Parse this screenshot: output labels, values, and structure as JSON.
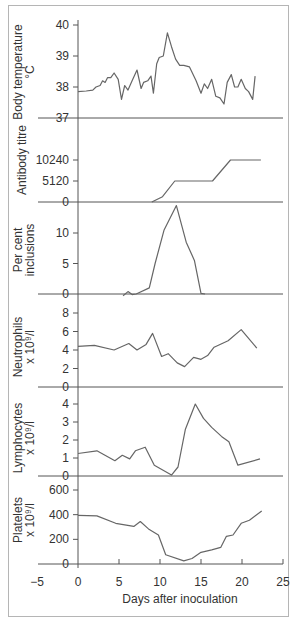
{
  "chart_data": {
    "type": "line",
    "title": "",
    "xlabel": "Days after inoculation",
    "xlim": [
      -5,
      25
    ],
    "x_ticks": [
      -5,
      0,
      5,
      10,
      15,
      20,
      25
    ],
    "grid": false,
    "panels": [
      {
        "id": "temperature",
        "ylabel": [
          "Body temperature",
          "°C"
        ],
        "ylim": [
          37,
          40
        ],
        "y_ticks": [
          37,
          38,
          39,
          40
        ],
        "y_tick_labels": [
          "37",
          "38",
          "39",
          "40"
        ],
        "x": [
          0,
          1,
          1.8,
          2.2,
          2.7,
          3.0,
          3.3,
          3.6,
          4.0,
          4.4,
          4.9,
          5.3,
          5.7,
          6.1,
          6.6,
          7.2,
          7.7,
          8.0,
          8.5,
          8.9,
          9.2,
          9.6,
          9.9,
          10.4,
          10.9,
          11.4,
          11.9,
          12.4,
          12.9,
          13.6,
          14.4,
          15.0,
          15.4,
          15.8,
          16.3,
          16.8,
          17.3,
          17.8,
          18.2,
          18.7,
          19.1,
          19.5,
          19.9,
          20.4,
          20.8,
          21.3,
          21.6
        ],
        "values": [
          37.85,
          37.87,
          37.9,
          38.0,
          38.05,
          38.2,
          38.15,
          38.3,
          38.3,
          38.45,
          38.25,
          37.6,
          38.05,
          37.9,
          38.2,
          38.55,
          37.95,
          38.15,
          38.2,
          38.35,
          37.8,
          38.75,
          38.95,
          39.0,
          39.75,
          39.3,
          38.9,
          38.7,
          38.7,
          38.65,
          38.2,
          37.8,
          38.1,
          37.95,
          38.25,
          37.7,
          37.65,
          37.45,
          38.15,
          38.4,
          38.0,
          38.0,
          38.25,
          37.95,
          37.85,
          37.6,
          38.35
        ]
      },
      {
        "id": "antibody",
        "ylabel": [
          "Antibody titre"
        ],
        "ylim": [
          0,
          10240
        ],
        "y_ticks": [
          0,
          5120,
          10240
        ],
        "y_tick_labels": [
          "0",
          "5120",
          "10240"
        ],
        "x": [
          9.0,
          10.3,
          11.8,
          16.4,
          18.6,
          22.3
        ],
        "values": [
          0,
          1300,
          5120,
          5120,
          10240,
          10240
        ]
      },
      {
        "id": "inclusions",
        "ylabel": [
          "Per cent",
          "inclusions"
        ],
        "ylim": [
          0,
          15
        ],
        "y_ticks": [
          0,
          5,
          10
        ],
        "y_tick_labels": [
          "0",
          "5",
          "10"
        ],
        "x": [
          5.5,
          6.1,
          6.6,
          7.1,
          8.7,
          9.4,
          10.5,
          12.0,
          13.2,
          14.2,
          15.0,
          15.5
        ],
        "values": [
          -0.3,
          0.4,
          -0.1,
          0.0,
          1.0,
          5.0,
          10.5,
          14.5,
          8.5,
          5.5,
          0.1,
          0.0
        ]
      },
      {
        "id": "neutrophils",
        "ylabel": [
          "Neutrophils",
          "x 10⁹/l"
        ],
        "ylim": [
          0,
          8
        ],
        "y_ticks": [
          0,
          2,
          4,
          6,
          8
        ],
        "y_tick_labels": [
          "0",
          "2",
          "4",
          "6",
          "8"
        ],
        "x": [
          0,
          2.0,
          4.4,
          6.2,
          7.2,
          8.3,
          9.1,
          10.2,
          11.0,
          12.1,
          13.0,
          14.1,
          15.0,
          15.8,
          16.6,
          18.3,
          19.9,
          21.8
        ],
        "values": [
          4.4,
          4.5,
          4.0,
          4.7,
          4.0,
          4.6,
          5.8,
          3.3,
          3.6,
          2.6,
          2.2,
          3.2,
          3.0,
          3.4,
          4.3,
          5.0,
          6.2,
          4.2
        ]
      },
      {
        "id": "lymphocytes",
        "ylabel": [
          "Lymphocytes",
          "x 10⁹/l"
        ],
        "ylim": [
          0,
          4
        ],
        "y_ticks": [
          0,
          1,
          2,
          3,
          4
        ],
        "y_tick_labels": [
          "0",
          "1",
          "2",
          "3",
          "4"
        ],
        "x": [
          0,
          2.3,
          4.5,
          5.4,
          6.3,
          7.0,
          8.2,
          9.3,
          11.4,
          12.2,
          13.1,
          14.3,
          15.3,
          16.3,
          17.5,
          18.4,
          19.5,
          22.2
        ],
        "values": [
          1.25,
          1.4,
          0.85,
          1.15,
          0.95,
          1.4,
          1.6,
          0.6,
          0.05,
          0.5,
          2.6,
          4.0,
          3.2,
          2.7,
          2.2,
          1.9,
          0.6,
          0.95
        ]
      },
      {
        "id": "platelets",
        "ylabel": [
          "Platelets",
          "x 10⁹/l"
        ],
        "ylim": [
          0,
          600
        ],
        "y_ticks": [
          0,
          200,
          400,
          600
        ],
        "y_tick_labels": [
          "0",
          "200",
          "400",
          "600"
        ],
        "x": [
          0,
          2.3,
          4.6,
          6.8,
          7.6,
          8.6,
          9.8,
          10.7,
          12.9,
          13.9,
          15.0,
          16.3,
          17.4,
          18.1,
          18.9,
          19.9,
          20.9,
          22.4
        ],
        "values": [
          395,
          390,
          330,
          305,
          345,
          285,
          235,
          75,
          25,
          45,
          95,
          115,
          135,
          225,
          235,
          330,
          355,
          430
        ]
      }
    ]
  }
}
